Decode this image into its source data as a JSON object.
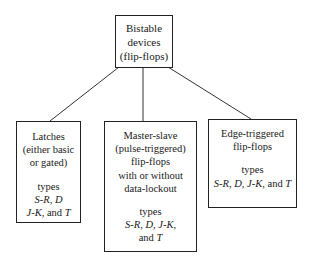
{
  "diagram": {
    "type": "hierarchy",
    "root": {
      "lines": [
        "Bistable",
        "devices",
        "(flip-flops)"
      ]
    },
    "children": [
      {
        "id": "latches",
        "title_lines": [
          "Latches",
          "(either basic",
          "or gated)"
        ],
        "types_label": "types",
        "types_lines": [
          "S-R, D",
          "J-K, and T"
        ]
      },
      {
        "id": "master-slave",
        "title_lines": [
          "Master-slave",
          "(pulse-triggered)",
          "flip-flops",
          "with or without",
          "data-lockout"
        ],
        "types_label": "types",
        "types_lines": [
          "S-R, D, J-K,",
          "and T"
        ]
      },
      {
        "id": "edge-triggered",
        "title_lines": [
          "Edge-triggered",
          "flip-flops"
        ],
        "types_label": "types",
        "types_lines": [
          "S-R, D, J-K, and T"
        ]
      }
    ],
    "edges": [
      {
        "from": "root",
        "to": "latches"
      },
      {
        "from": "root",
        "to": "master-slave"
      },
      {
        "from": "root",
        "to": "edge-triggered"
      }
    ]
  }
}
